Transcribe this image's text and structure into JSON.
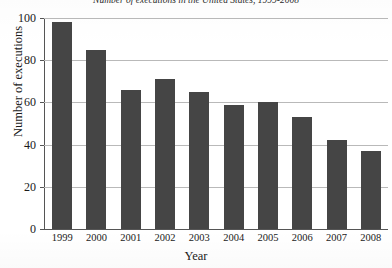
{
  "chart_data": {
    "type": "bar",
    "title": "Number of executions in the United States, 1999-2008",
    "xlabel": "Year",
    "ylabel": "Number of executions",
    "categories": [
      "1999",
      "2000",
      "2001",
      "2002",
      "2003",
      "2004",
      "2005",
      "2006",
      "2007",
      "2008"
    ],
    "values": [
      98,
      85,
      66,
      71,
      65,
      59,
      60,
      53,
      42,
      37
    ],
    "ylim": [
      0,
      100
    ],
    "yticks": [
      0,
      20,
      40,
      60,
      80,
      100
    ],
    "ytick_labels": [
      "0",
      "20",
      "40",
      "60",
      "80",
      "100"
    ],
    "grid": true,
    "legend": false,
    "bar_color": "#454545",
    "gridline_color": "#b9b9b9",
    "axis_color": "#555555"
  }
}
